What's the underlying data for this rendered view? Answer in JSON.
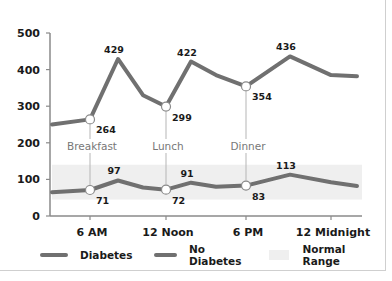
{
  "chart_data": {
    "type": "line",
    "title": "",
    "xlabel": "",
    "ylabel": "",
    "ylim": [
      0,
      500
    ],
    "yticks": [
      0,
      100,
      200,
      300,
      400,
      500
    ],
    "xticks": [
      "6 AM",
      "12 Noon",
      "6 PM",
      "12 Midnight"
    ],
    "grid": false,
    "legend_position": "bottom",
    "normal_range": {
      "label": "Normal Range",
      "low": 45,
      "high": 140,
      "color": "#efefef"
    },
    "meals": [
      {
        "label": "Breakfast",
        "time": "6 AM"
      },
      {
        "label": "Lunch",
        "time": "12 Noon"
      },
      {
        "label": "Dinner",
        "time": "6 PM"
      }
    ],
    "series": [
      {
        "name": "Diabetes",
        "color": "#707070",
        "points": [
          {
            "x": 0,
            "y": 250
          },
          {
            "x": 1,
            "y": 264,
            "label": "264",
            "marker": true
          },
          {
            "x": 2,
            "y": 429,
            "label": "429"
          },
          {
            "x": 3,
            "y": 330
          },
          {
            "x": 4,
            "y": 299,
            "label": "299",
            "marker": true
          },
          {
            "x": 5,
            "y": 422,
            "label": "422"
          },
          {
            "x": 6,
            "y": 385
          },
          {
            "x": 7,
            "y": 354,
            "label": "354",
            "marker": true
          },
          {
            "x": 8,
            "y": 436,
            "label": "436"
          },
          {
            "x": 9,
            "y": 385
          },
          {
            "x": 10,
            "y": 382
          }
        ]
      },
      {
        "name": "No Diabetes",
        "color": "#707070",
        "points": [
          {
            "x": 0,
            "y": 65
          },
          {
            "x": 1,
            "y": 71,
            "label": "71",
            "marker": true
          },
          {
            "x": 2,
            "y": 97,
            "label": "97"
          },
          {
            "x": 3,
            "y": 78
          },
          {
            "x": 4,
            "y": 72,
            "label": "72",
            "marker": true
          },
          {
            "x": 5,
            "y": 91,
            "label": "91"
          },
          {
            "x": 6,
            "y": 80
          },
          {
            "x": 7,
            "y": 83,
            "label": "83",
            "marker": true
          },
          {
            "x": 8,
            "y": 113,
            "label": "113"
          },
          {
            "x": 9,
            "y": 92
          },
          {
            "x": 10,
            "y": 82
          }
        ]
      }
    ]
  },
  "legend": {
    "diabetes": "Diabetes",
    "no_diabetes": "No Diabetes",
    "normal_range": "Normal Range"
  }
}
